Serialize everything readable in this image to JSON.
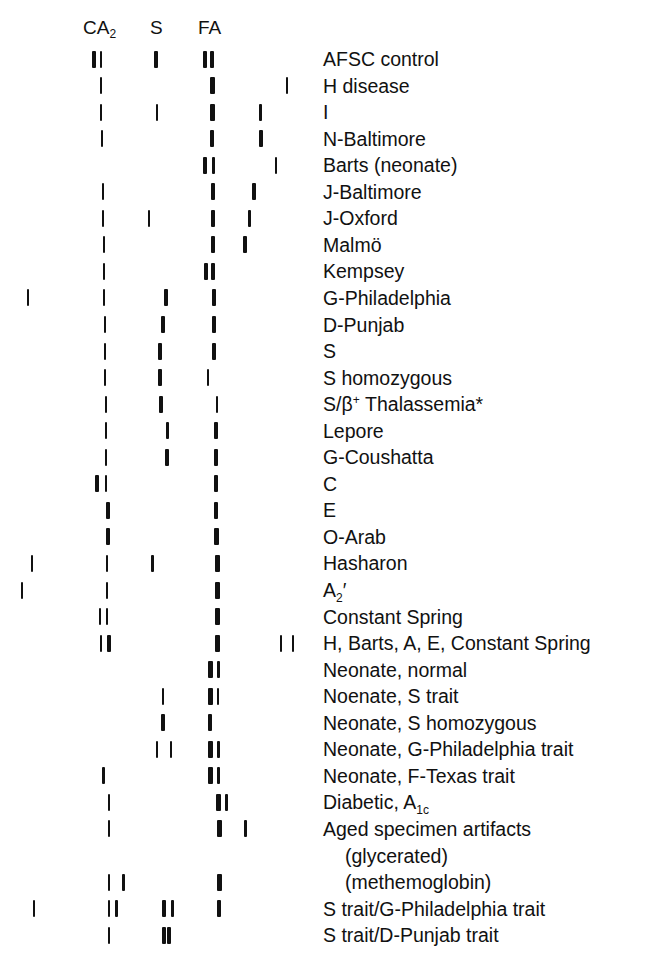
{
  "header": {
    "ca2": "CA",
    "ca2_sub": "2",
    "s": "S",
    "fa": "FA"
  },
  "chart_data": {
    "type": "diagram",
    "title": "",
    "column_markers": [
      {
        "label": "CA2",
        "x": 100
      },
      {
        "label": "S",
        "x": 157
      },
      {
        "label": "FA",
        "x": 210
      }
    ],
    "rows": [
      {
        "label": "AFSC control",
        "bands": [
          [
            94,
            4
          ],
          [
            101,
            2
          ],
          [
            156,
            4
          ],
          [
            205,
            4
          ],
          [
            212,
            4
          ]
        ]
      },
      {
        "label": "H disease",
        "bands": [
          [
            101,
            1.5
          ],
          [
            212,
            5
          ],
          [
            287,
            1.5
          ]
        ]
      },
      {
        "label": "I",
        "bands": [
          [
            101,
            1.5
          ],
          [
            157,
            1.5
          ],
          [
            212,
            5
          ],
          [
            260,
            3
          ]
        ]
      },
      {
        "label": "N-Baltimore",
        "bands": [
          [
            102,
            1.5
          ],
          [
            212,
            4
          ],
          [
            261,
            4
          ]
        ]
      },
      {
        "label": "Barts (neonate)",
        "bands": [
          [
            205,
            4
          ],
          [
            213,
            3
          ],
          [
            276,
            1.5
          ]
        ]
      },
      {
        "label": "J-Baltimore",
        "bands": [
          [
            103,
            1.5
          ],
          [
            213,
            4
          ],
          [
            254,
            4
          ]
        ]
      },
      {
        "label": "J-Oxford",
        "bands": [
          [
            103,
            1.5
          ],
          [
            149,
            1.5
          ],
          [
            213,
            4
          ],
          [
            249,
            3
          ]
        ]
      },
      {
        "label": "Malmö",
        "bands": [
          [
            104,
            1.5
          ],
          [
            213,
            4
          ],
          [
            245,
            4
          ]
        ]
      },
      {
        "label": "Kempsey",
        "bands": [
          [
            104,
            1.5
          ],
          [
            206,
            4
          ],
          [
            213,
            4
          ]
        ]
      },
      {
        "label": "G-Philadelphia",
        "bands": [
          [
            28,
            1.5
          ],
          [
            104,
            1.5
          ],
          [
            166,
            3.5
          ],
          [
            214,
            4
          ]
        ]
      },
      {
        "label": "D-Punjab",
        "bands": [
          [
            105,
            1.5
          ],
          [
            163,
            4
          ],
          [
            214,
            4
          ]
        ]
      },
      {
        "label": "S",
        "bands": [
          [
            105,
            1.5
          ],
          [
            160,
            4
          ],
          [
            214,
            4
          ]
        ]
      },
      {
        "label": "S homozygous",
        "bands": [
          [
            105,
            1.5
          ],
          [
            160,
            4
          ],
          [
            208,
            1.5
          ]
        ]
      },
      {
        "label": "S/β+ Thalassemia*",
        "bands": [
          [
            106,
            1.5
          ],
          [
            161,
            4
          ],
          [
            217,
            1.5
          ]
        ]
      },
      {
        "label": "Lepore",
        "bands": [
          [
            106,
            1.5
          ],
          [
            167,
            3
          ],
          [
            216,
            4.5
          ]
        ]
      },
      {
        "label": "G-Coushatta",
        "bands": [
          [
            106,
            1.5
          ],
          [
            167,
            4
          ],
          [
            216,
            4.5
          ]
        ]
      },
      {
        "label": "C",
        "bands": [
          [
            97,
            4
          ],
          [
            106,
            1.5
          ],
          [
            216,
            4.5
          ]
        ]
      },
      {
        "label": "E",
        "bands": [
          [
            108,
            4
          ],
          [
            216,
            4.5
          ]
        ]
      },
      {
        "label": "O-Arab",
        "bands": [
          [
            108,
            4
          ],
          [
            216,
            5
          ]
        ]
      },
      {
        "label": "Hasharon",
        "bands": [
          [
            32,
            1.5
          ],
          [
            107,
            1.5
          ],
          [
            152,
            3
          ],
          [
            217,
            5
          ]
        ]
      },
      {
        "label": "A2′",
        "bands": [
          [
            22,
            1.5
          ],
          [
            107,
            1.5
          ],
          [
            217,
            5
          ]
        ]
      },
      {
        "label": "Constant Spring",
        "bands": [
          [
            100,
            1.5
          ],
          [
            107,
            1.5
          ],
          [
            217,
            5
          ]
        ]
      },
      {
        "label": "H, Barts, A, E, Constant Spring",
        "bands": [
          [
            101,
            1.5
          ],
          [
            109,
            3.5
          ],
          [
            217,
            5
          ],
          [
            281,
            1.5
          ],
          [
            293,
            1.5
          ]
        ]
      },
      {
        "label": "Neonate, normal",
        "bands": [
          [
            210,
            5
          ],
          [
            218,
            3
          ]
        ]
      },
      {
        "label": "Noenate, S trait",
        "bands": [
          [
            163,
            1.5
          ],
          [
            210,
            5
          ],
          [
            218,
            1.5
          ]
        ]
      },
      {
        "label": "Neonate, S homozygous",
        "bands": [
          [
            163,
            4
          ],
          [
            210,
            4
          ]
        ]
      },
      {
        "label": "Neonate, G-Philadelphia trait",
        "bands": [
          [
            157,
            1.5
          ],
          [
            171,
            1.5
          ],
          [
            210,
            5
          ],
          [
            218,
            3
          ]
        ]
      },
      {
        "label": "Neonate, F-Texas trait",
        "bands": [
          [
            103,
            3
          ],
          [
            210,
            5
          ],
          [
            218,
            3
          ]
        ]
      },
      {
        "label": "Diabetic, A1c",
        "bands": [
          [
            109,
            1.5
          ],
          [
            218,
            5
          ],
          [
            226,
            3
          ]
        ]
      },
      {
        "label": "Aged specimen artifacts",
        "bands": [
          [
            109,
            1.5
          ],
          [
            219,
            5
          ],
          [
            245,
            3
          ]
        ]
      },
      {
        "label": "(glycerated)",
        "bands": []
      },
      {
        "label": "(methemoglobin)",
        "bands": [
          [
            109,
            1.5
          ],
          [
            123,
            3
          ],
          [
            219,
            5
          ]
        ]
      },
      {
        "label": "S trait/G-Philadelphia trait",
        "bands": [
          [
            34,
            1.5
          ],
          [
            109,
            1.5
          ],
          [
            116,
            3
          ],
          [
            164,
            4.5
          ],
          [
            172,
            3
          ],
          [
            219,
            4
          ]
        ]
      },
      {
        "label": "S trait/D-Punjab trait",
        "bands": [
          [
            109,
            1.5
          ],
          [
            164,
            4
          ],
          [
            169,
            4
          ]
        ]
      }
    ]
  },
  "labels": [
    {
      "text": "AFSC control"
    },
    {
      "text": "H disease"
    },
    {
      "text": "I"
    },
    {
      "text": "N-Baltimore"
    },
    {
      "text": "Barts (neonate)"
    },
    {
      "text": "J-Baltimore"
    },
    {
      "text": "J-Oxford"
    },
    {
      "text": "Malmö"
    },
    {
      "text": "Kempsey"
    },
    {
      "text": "G-Philadelphia"
    },
    {
      "text": "D-Punjab"
    },
    {
      "text": "S"
    },
    {
      "text": "S homozygous"
    },
    {
      "text": "S/β",
      "sup": "+",
      "after": " Thalassemia*"
    },
    {
      "text": "Lepore"
    },
    {
      "text": "G-Coushatta"
    },
    {
      "text": "C"
    },
    {
      "text": "E"
    },
    {
      "text": "O-Arab"
    },
    {
      "text": "Hasharon"
    },
    {
      "text": "A",
      "sub": "2",
      "after": "′"
    },
    {
      "text": "Constant Spring"
    },
    {
      "text": "H, Barts, A, E, Constant Spring"
    },
    {
      "text": "Neonate, normal"
    },
    {
      "text": "Noenate, S trait"
    },
    {
      "text": "Neonate, S homozygous"
    },
    {
      "text": "Neonate, G-Philadelphia trait"
    },
    {
      "text": "Neonate, F-Texas trait"
    },
    {
      "text": "Diabetic, A",
      "sub": "1c"
    },
    {
      "text": "Aged specimen artifacts"
    },
    {
      "text": "(glycerated)",
      "indent": true
    },
    {
      "text": "(methemoglobin)",
      "indent": true
    },
    {
      "text": "S trait/G-Philadelphia trait"
    },
    {
      "text": "S trait/D-Punjab trait"
    }
  ],
  "layout": {
    "row0_y": 59,
    "row_spacing": 26.55,
    "band_height": 17,
    "band_color": "#111111"
  }
}
